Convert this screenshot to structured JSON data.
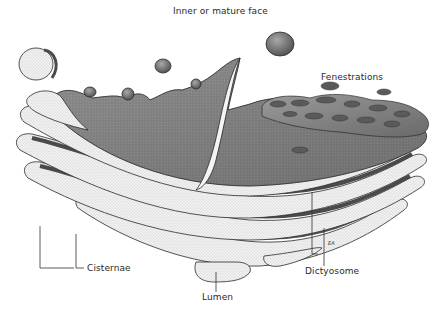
{
  "figure": {
    "labels": {
      "inner_face": "Inner or mature face",
      "fenestrations": "Fenestrations",
      "cisternae": "Cisternae",
      "lumen": "Lumen",
      "dictyosome": "Dictyosome"
    },
    "signature": "EA",
    "colors": {
      "background": "#ffffff",
      "ink": "#2a2a2a",
      "dark_fill": "#6e6e6e",
      "mid_fill": "#8c8c8c",
      "light_fill": "#e6e6e6",
      "leader_line": "#333333"
    }
  }
}
